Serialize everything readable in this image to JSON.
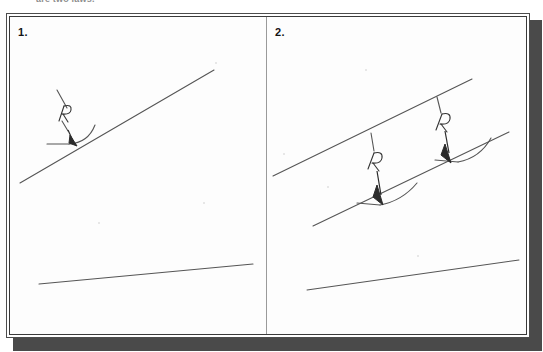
{
  "page": {
    "width": 543,
    "height": 352,
    "background_color": "#ffffff",
    "top_caption": "are two laws.",
    "shadow_color": "#4a4a4a",
    "frame_border_color": "#4d4d4d",
    "ink_color": "#555555",
    "label_color": "#141414"
  },
  "panels": [
    {
      "id": "panel-1",
      "number": "1.",
      "annotations": [
        {
          "label": "R",
          "name": "radius-callout"
        }
      ],
      "elements": {
        "upper_line": "long straight line rising left-to-right",
        "lower_line": "shallow straight line near bottom",
        "fillet_curve": "short concave arc meeting a horizontal stub",
        "leader_line": "broken leader from upper-left down to R",
        "arrow": "arrow head pointing down-right onto the fillet"
      }
    },
    {
      "id": "panel-2",
      "number": "2.",
      "annotations": [
        {
          "label": "R",
          "name": "radius-callout-lower"
        },
        {
          "label": "R",
          "name": "radius-callout-upper"
        }
      ],
      "elements": {
        "upper_line": "long straight line rising left-to-right",
        "middle_line": "parallel straight line below the upper line",
        "lower_line": "shallow straight line near bottom",
        "fillet_curve_lower": "short concave arc with horizontal stub",
        "fillet_curve_upper": "short concave arc with horizontal stub",
        "leader_lines": "two short leaders dropping from the upper line",
        "arrows": "two arrow heads pointing down onto each fillet"
      }
    }
  ]
}
